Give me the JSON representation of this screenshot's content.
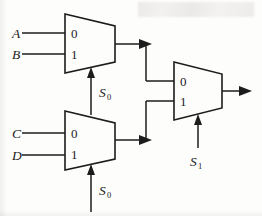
{
  "figure": {
    "background_color": "#fdfdfb",
    "line_color": "#1c1c1c",
    "width": 262,
    "height": 216
  },
  "inputs": [
    {
      "name": "input-a",
      "label": "A",
      "connects_to": "mux-top",
      "port": "0"
    },
    {
      "name": "input-b",
      "label": "B",
      "connects_to": "mux-top",
      "port": "1"
    },
    {
      "name": "input-c",
      "label": "C",
      "connects_to": "mux-bottom",
      "port": "0"
    },
    {
      "name": "input-d",
      "label": "D",
      "connects_to": "mux-bottom",
      "port": "1"
    }
  ],
  "select_labels": [
    {
      "name": "select-s0-top",
      "base": "S",
      "subscript": "0",
      "target": "mux-top"
    },
    {
      "name": "select-s0-bottom",
      "base": "S",
      "subscript": "0",
      "target": "mux-bottom"
    },
    {
      "name": "select-s1-right",
      "base": "S",
      "subscript": "1",
      "target": "mux-right"
    }
  ],
  "muxes": [
    {
      "name": "mux-top",
      "port_labels": [
        "0",
        "1"
      ],
      "inputs": [
        "A",
        "B"
      ],
      "select": "S0"
    },
    {
      "name": "mux-bottom",
      "port_labels": [
        "0",
        "1"
      ],
      "inputs": [
        "C",
        "D"
      ],
      "select": "S0"
    },
    {
      "name": "mux-right",
      "port_labels": [
        "0",
        "1"
      ],
      "inputs": [
        "mux-top-output",
        "mux-bottom-output"
      ],
      "select": "S1"
    }
  ],
  "output": {
    "name": "circuit-output",
    "label": ""
  }
}
